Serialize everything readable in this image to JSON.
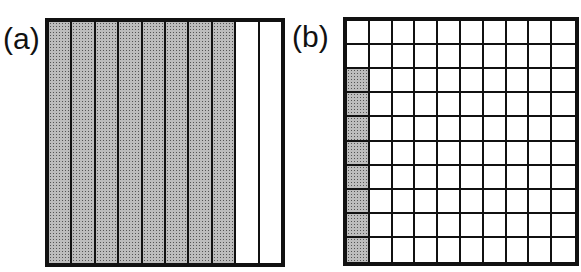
{
  "figure": {
    "panel_a": {
      "label": "(a)",
      "type": "strip-model",
      "strips_total": 10,
      "strips_shaded": 8,
      "orientation": "vertical",
      "represents": "8/10 shaded"
    },
    "panel_b": {
      "label": "(b)",
      "type": "hundred-grid",
      "rows": 10,
      "cols": 10,
      "shaded_cells": [
        [
          2,
          0
        ],
        [
          3,
          0
        ],
        [
          4,
          0
        ],
        [
          5,
          0
        ],
        [
          6,
          0
        ],
        [
          7,
          0
        ],
        [
          8,
          0
        ],
        [
          9,
          0
        ]
      ],
      "shaded_count": 8,
      "represents": "8/100 shaded"
    },
    "colors": {
      "border": "#111111",
      "shade": "#bdbdbd",
      "background": "#ffffff"
    }
  }
}
